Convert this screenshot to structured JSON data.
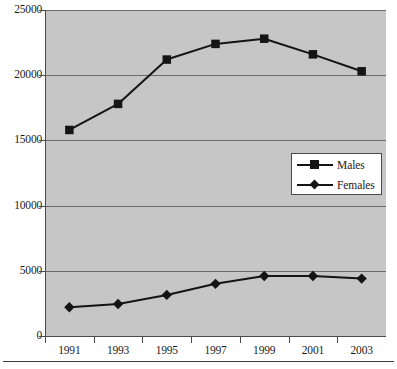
{
  "chart_data": {
    "type": "line",
    "title": "",
    "subtitle": "",
    "xlabel": "",
    "ylabel": "",
    "categories": [
      "1991",
      "1993",
      "1995",
      "1997",
      "1999",
      "2001",
      "2003"
    ],
    "x": [
      1991,
      1993,
      1995,
      1997,
      1999,
      2001,
      2003
    ],
    "series": [
      {
        "name": "Males",
        "marker": "square",
        "color": "#141414",
        "values": [
          15800,
          17800,
          21200,
          22400,
          22800,
          21600,
          20300
        ]
      },
      {
        "name": "Females",
        "marker": "diamond",
        "color": "#141414",
        "values": [
          2200,
          2450,
          3150,
          4000,
          4600,
          4600,
          4400
        ]
      }
    ],
    "ylim": [
      0,
      25000
    ],
    "yticks": [
      0,
      5000,
      10000,
      15000,
      20000,
      25000
    ],
    "ytick_labels": [
      "0",
      "5000",
      "10000",
      "15000",
      "20000",
      "25000"
    ],
    "xtick_labels": [
      "1991",
      "1993",
      "1995",
      "1997",
      "1999",
      "2001",
      "2003"
    ],
    "grid": "horizontal",
    "legend_position": "center-right",
    "plot_background": "#c6c6c6",
    "figure_background": "#ffffff"
  },
  "legend": {
    "entries": [
      {
        "label": "Males",
        "marker": "square"
      },
      {
        "label": "Females",
        "marker": "diamond"
      }
    ]
  }
}
